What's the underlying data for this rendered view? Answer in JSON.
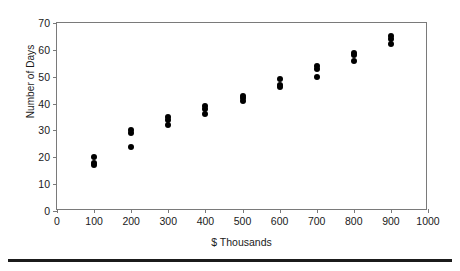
{
  "chart_data": {
    "type": "scatter",
    "title": "",
    "xlabel": "$ Thousands",
    "ylabel": "Number of Days",
    "xlim": [
      0,
      1000
    ],
    "ylim": [
      0,
      70
    ],
    "xticks": [
      0,
      100,
      200,
      300,
      400,
      500,
      600,
      700,
      800,
      900,
      1000
    ],
    "yticks": [
      0,
      10,
      20,
      30,
      40,
      50,
      60,
      70
    ],
    "grid": false,
    "legend": null,
    "marker": "filled-diamond",
    "marker_color": "#000000",
    "x": [
      100,
      100,
      100,
      200,
      200,
      200,
      300,
      300,
      300,
      400,
      400,
      400,
      500,
      500,
      500,
      600,
      600,
      600,
      700,
      700,
      700,
      800,
      800,
      800,
      900,
      900,
      900
    ],
    "y": [
      20,
      18,
      17,
      30,
      29,
      24,
      35,
      34,
      32,
      39,
      38,
      36,
      43,
      42,
      41,
      49,
      47,
      46,
      54,
      53,
      50,
      59,
      58,
      56,
      65,
      64,
      62
    ],
    "points": [
      {
        "x": 100,
        "y": 20
      },
      {
        "x": 100,
        "y": 18
      },
      {
        "x": 100,
        "y": 17
      },
      {
        "x": 200,
        "y": 30
      },
      {
        "x": 200,
        "y": 29
      },
      {
        "x": 200,
        "y": 24
      },
      {
        "x": 300,
        "y": 35
      },
      {
        "x": 300,
        "y": 34
      },
      {
        "x": 300,
        "y": 32
      },
      {
        "x": 400,
        "y": 39
      },
      {
        "x": 400,
        "y": 38
      },
      {
        "x": 400,
        "y": 36
      },
      {
        "x": 500,
        "y": 43
      },
      {
        "x": 500,
        "y": 42
      },
      {
        "x": 500,
        "y": 41
      },
      {
        "x": 600,
        "y": 49
      },
      {
        "x": 600,
        "y": 47
      },
      {
        "x": 600,
        "y": 46
      },
      {
        "x": 700,
        "y": 54
      },
      {
        "x": 700,
        "y": 53
      },
      {
        "x": 700,
        "y": 50
      },
      {
        "x": 800,
        "y": 59
      },
      {
        "x": 800,
        "y": 58
      },
      {
        "x": 800,
        "y": 56
      },
      {
        "x": 900,
        "y": 65
      },
      {
        "x": 900,
        "y": 64
      },
      {
        "x": 900,
        "y": 62
      }
    ]
  },
  "axis": {
    "ylabel_text": "Number of Days",
    "xlabel_text": "$ Thousands",
    "ytick_labels": [
      "0",
      "10",
      "20",
      "30",
      "40",
      "50",
      "60",
      "70"
    ],
    "xtick_labels": [
      "0",
      "100",
      "200",
      "300",
      "400",
      "500",
      "600",
      "700",
      "800",
      "900",
      "1000"
    ]
  },
  "style": {
    "frame_color": "#7a7a7a",
    "marker_color": "#000000",
    "text_color": "#1a1a1a",
    "rule_color": "#1b1b1b",
    "background": "#ffffff"
  }
}
